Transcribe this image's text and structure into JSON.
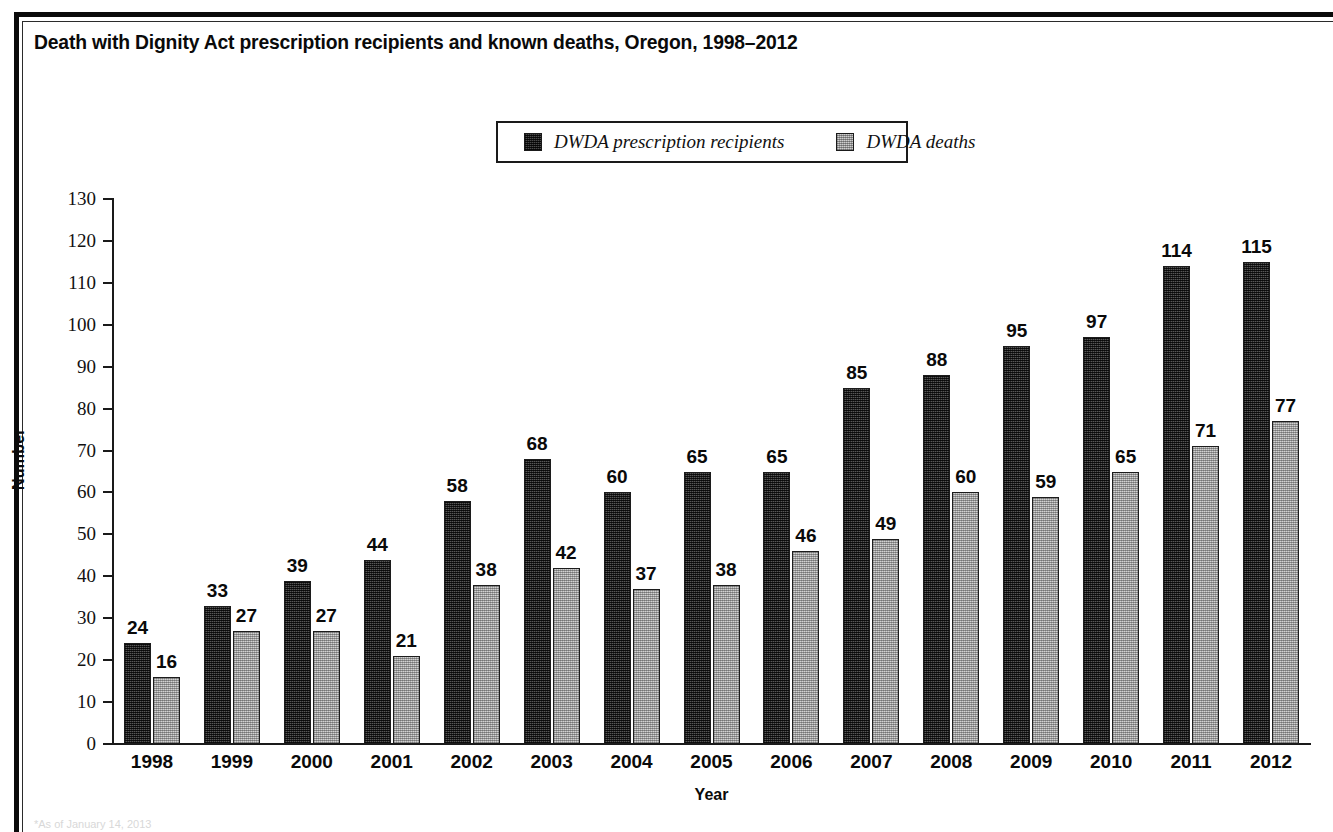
{
  "title": "Death with Dignity Act prescription recipients and known deaths, Oregon, 1998–2012",
  "footnote": "*As of January 14, 2013",
  "legend": {
    "items": [
      {
        "label": "DWDA prescription recipients",
        "swatch": "dark-hatch-swatch",
        "color": "#575757"
      },
      {
        "label": "DWDA deaths",
        "swatch": "light-hatch-swatch",
        "color": "#d2d2d2"
      }
    ]
  },
  "axes": {
    "y_label": "Number",
    "x_label": "Year",
    "y_ticks": [
      "0",
      "10",
      "20",
      "30",
      "40",
      "50",
      "60",
      "70",
      "80",
      "90",
      "100",
      "110",
      "120",
      "130"
    ],
    "x_ticks": [
      "1998",
      "1999",
      "2000",
      "2001",
      "2002",
      "2003",
      "2004",
      "2005",
      "2006",
      "2007",
      "2008",
      "2009",
      "2010",
      "2011",
      "2012"
    ]
  },
  "chart_data": {
    "type": "bar",
    "title": "Death with Dignity Act prescription recipients and known deaths, Oregon, 1998–2012",
    "xlabel": "Year",
    "ylabel": "Number",
    "ylim": [
      0,
      130
    ],
    "ytick_step": 10,
    "grid": false,
    "legend_position": "top-center",
    "categories": [
      "1998",
      "1999",
      "2000",
      "2001",
      "2002",
      "2003",
      "2004",
      "2005",
      "2006",
      "2007",
      "2008",
      "2009",
      "2010",
      "2011",
      "2012"
    ],
    "series": [
      {
        "name": "DWDA prescription recipients",
        "color": "#575757",
        "values": [
          24,
          33,
          39,
          44,
          58,
          68,
          60,
          65,
          65,
          85,
          88,
          95,
          97,
          114,
          115
        ]
      },
      {
        "name": "DWDA deaths",
        "color": "#d2d2d2",
        "values": [
          16,
          27,
          27,
          21,
          38,
          42,
          37,
          38,
          46,
          49,
          60,
          59,
          65,
          71,
          77
        ]
      }
    ]
  }
}
